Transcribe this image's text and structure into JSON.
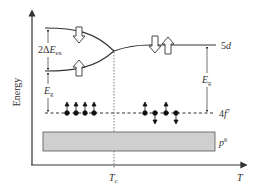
{
  "axes": {
    "y_label": "Energy",
    "x_label": "T",
    "x_marker": {
      "label": "T",
      "sub": "c"
    }
  },
  "levels": {
    "d": {
      "label": "5",
      "label_italic": "d"
    },
    "f": {
      "label": "4",
      "label_italic": "f",
      "sup": "7"
    },
    "p": {
      "label_italic": "p",
      "sup": "6"
    }
  },
  "annotations": {
    "exchange_split": {
      "prefix": "2Δ",
      "main": "E",
      "sub": "ex"
    },
    "gap_left": {
      "main": "E",
      "sub": "g"
    },
    "gap_right": {
      "main": "E",
      "sub": "g"
    }
  },
  "colors": {
    "line": "#333333",
    "band_fill": "#cfcfcf",
    "band_stroke": "#555555"
  }
}
